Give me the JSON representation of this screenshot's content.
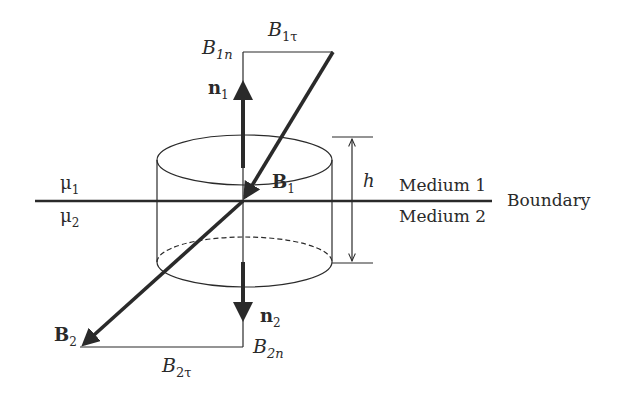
{
  "figure": {
    "type": "boundary-condition-diagram",
    "colors": {
      "stroke": "#2a2a2a",
      "background": "#ffffff"
    },
    "labels": {
      "mu1": "μ",
      "mu1_sub": "1",
      "mu2": "μ",
      "mu2_sub": "2",
      "medium1": "Medium 1",
      "medium2": "Medium 2",
      "boundary": "Boundary",
      "h": "h",
      "B1": "B",
      "B1_sub": "1",
      "B2": "B",
      "B2_sub": "2",
      "n1": "n",
      "n1_sub": "1",
      "n2": "n",
      "n2_sub": "2",
      "B1n": "B",
      "B1n_sub": "1n",
      "B1t": "B",
      "B1t_sub": "1τ",
      "B2n": "B",
      "B2n_sub": "2n",
      "B2t": "B",
      "B2t_sub": "2τ"
    }
  }
}
